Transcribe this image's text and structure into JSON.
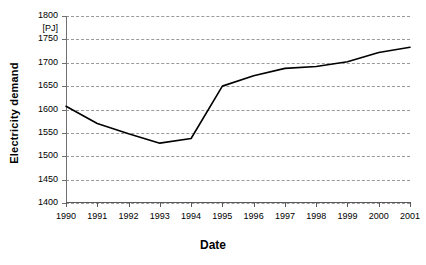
{
  "chart_data": {
    "type": "line",
    "title": "",
    "xlabel": "Date",
    "ylabel": "Electricity demand",
    "unit_label": "[PJ]",
    "categories": [
      "1990",
      "1991",
      "1992",
      "1993",
      "1994",
      "1995",
      "1996",
      "1997",
      "1998",
      "1999",
      "2000",
      "2001"
    ],
    "values": [
      1607,
      1570,
      1548,
      1528,
      1538,
      1650,
      1672,
      1688,
      1692,
      1702,
      1722,
      1733
    ],
    "series": [
      {
        "name": "Electricity demand",
        "values": [
          1607,
          1570,
          1548,
          1528,
          1538,
          1650,
          1672,
          1688,
          1692,
          1702,
          1722,
          1733
        ],
        "color": "#000000"
      }
    ],
    "ylim": [
      1400,
      1800
    ],
    "ytick_step": 50,
    "yticks": [
      1400,
      1450,
      1500,
      1550,
      1600,
      1650,
      1700,
      1750,
      1800
    ],
    "ytick_labels": [
      "1400",
      "1450",
      "1500",
      "1550",
      "1600",
      "1650",
      "1700",
      "1750",
      "1800"
    ],
    "xticks": [
      "1990",
      "1991",
      "1992",
      "1993",
      "1994",
      "1995",
      "1996",
      "1997",
      "1998",
      "1999",
      "2000",
      "2001"
    ],
    "grid": "horizontal-dashed",
    "legend": "none",
    "marker": "none",
    "line_color": "#000000",
    "grid_color": "#9a9a9a",
    "axis_color": "#5a5a5a",
    "background": "#ffffff"
  }
}
